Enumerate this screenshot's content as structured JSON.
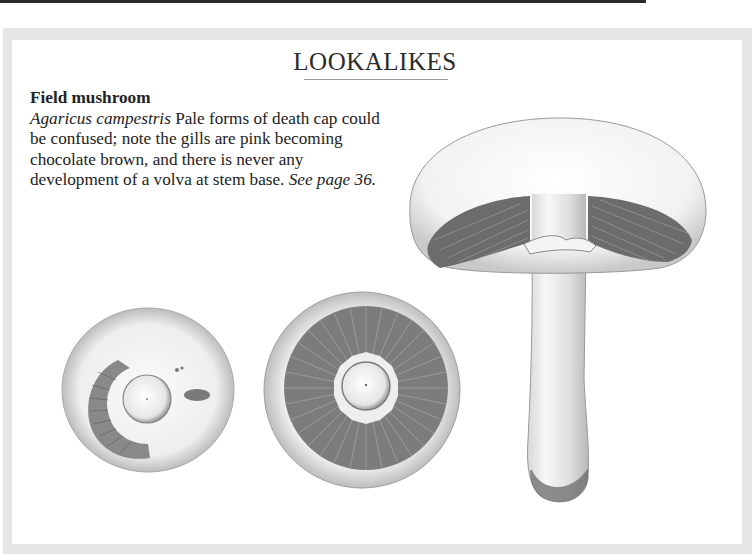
{
  "page": {
    "section_title": "LOOKALIKES"
  },
  "entry": {
    "common_name": "Field mushroom",
    "latin_name": "Agaricus campestris",
    "description": " Pale forms of death cap could be confused; note the gills are pink becoming chocolate brown, and there is never any development of a volva at stem base. ",
    "cross_reference": "See page 36."
  },
  "illustrations": [
    {
      "name": "field-mushroom-cap-underside-young",
      "subject": "Field mushroom, cap underside view (young, partial veil)"
    },
    {
      "name": "field-mushroom-cap-underside-mature",
      "subject": "Field mushroom, cap underside view showing radiating gills"
    },
    {
      "name": "field-mushroom-side-view",
      "subject": "Field mushroom, side view with cap, gills, ring and stem"
    }
  ],
  "colors": {
    "frame": "#e6e6e6",
    "panel": "#ffffff",
    "text": "#222222",
    "gill_shade": "#6f6f6f"
  }
}
